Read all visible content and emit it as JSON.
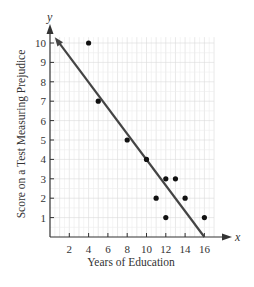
{
  "chart_data": {
    "type": "scatter",
    "title": "",
    "xlabel": "Years of Education",
    "ylabel": "Score on a Test Measuring Prejudice",
    "x_axis_var": "x",
    "y_axis_var": "y",
    "xlim": [
      0,
      17
    ],
    "ylim": [
      0,
      10.5
    ],
    "x_ticks": [
      2,
      4,
      6,
      8,
      10,
      12,
      14,
      16
    ],
    "y_ticks": [
      1,
      2,
      3,
      4,
      5,
      6,
      7,
      8,
      9,
      10
    ],
    "grid": true,
    "legend": null,
    "series": [
      {
        "name": "data points",
        "type": "scatter",
        "points": [
          {
            "x": 4,
            "y": 10
          },
          {
            "x": 5,
            "y": 7
          },
          {
            "x": 8,
            "y": 5
          },
          {
            "x": 10,
            "y": 4
          },
          {
            "x": 11,
            "y": 2
          },
          {
            "x": 12,
            "y": 3
          },
          {
            "x": 12,
            "y": 1
          },
          {
            "x": 13,
            "y": 3
          },
          {
            "x": 14,
            "y": 2
          },
          {
            "x": 16,
            "y": 1
          }
        ]
      },
      {
        "name": "regression line",
        "type": "line",
        "points": [
          {
            "x": 0.5,
            "y": 10.3
          },
          {
            "x": 16.0,
            "y": 0
          }
        ],
        "arrow_end": "upper-left"
      }
    ]
  },
  "colors": {
    "axis": "#333333",
    "grid_minor": "#ececec",
    "grid_major": "#dadada",
    "points": "#111111",
    "line": "#444444"
  }
}
